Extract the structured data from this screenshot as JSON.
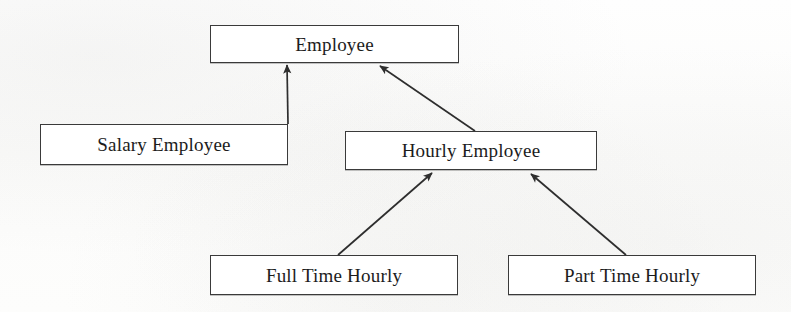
{
  "diagram": {
    "type": "uml-class-inheritance",
    "background_color": "#fdfdfc",
    "box_fill": "#ffffff",
    "line_color": "#3a3a3a",
    "text_color": "#1c1c1c",
    "nodes": [
      {
        "id": "employee",
        "label": "Employee",
        "x": 210,
        "y": 25,
        "width": 249,
        "height": 38
      },
      {
        "id": "salary_employee",
        "label": "Salary Employee",
        "x": 40,
        "y": 124,
        "width": 248,
        "height": 41
      },
      {
        "id": "hourly_employee",
        "label": "Hourly Employee",
        "x": 345,
        "y": 131,
        "width": 252,
        "height": 39
      },
      {
        "id": "full_time_hourly",
        "label": "Full Time Hourly",
        "x": 210,
        "y": 255,
        "width": 248,
        "height": 40
      },
      {
        "id": "part_time_hourly",
        "label": "Part Time Hourly",
        "x": 508,
        "y": 255,
        "width": 248,
        "height": 40
      }
    ],
    "edges": [
      {
        "id": "salary-to-employee",
        "from": "salary_employee",
        "to": "employee",
        "relation": "generalization",
        "arrow": "filled",
        "x1": 288,
        "y1": 124,
        "x2": 287,
        "y2": 65
      },
      {
        "id": "hourly-to-employee",
        "from": "hourly_employee",
        "to": "employee",
        "relation": "generalization",
        "arrow": "filled",
        "x1": 475,
        "y1": 131,
        "x2": 380,
        "y2": 66
      },
      {
        "id": "fulltime-to-hourly",
        "from": "full_time_hourly",
        "to": "hourly_employee",
        "relation": "generalization",
        "arrow": "filled",
        "x1": 338,
        "y1": 255,
        "x2": 432,
        "y2": 173
      },
      {
        "id": "parttime-to-hourly",
        "from": "part_time_hourly",
        "to": "hourly_employee",
        "relation": "generalization",
        "arrow": "filled",
        "x1": 626,
        "y1": 255,
        "x2": 531,
        "y2": 174
      }
    ]
  }
}
